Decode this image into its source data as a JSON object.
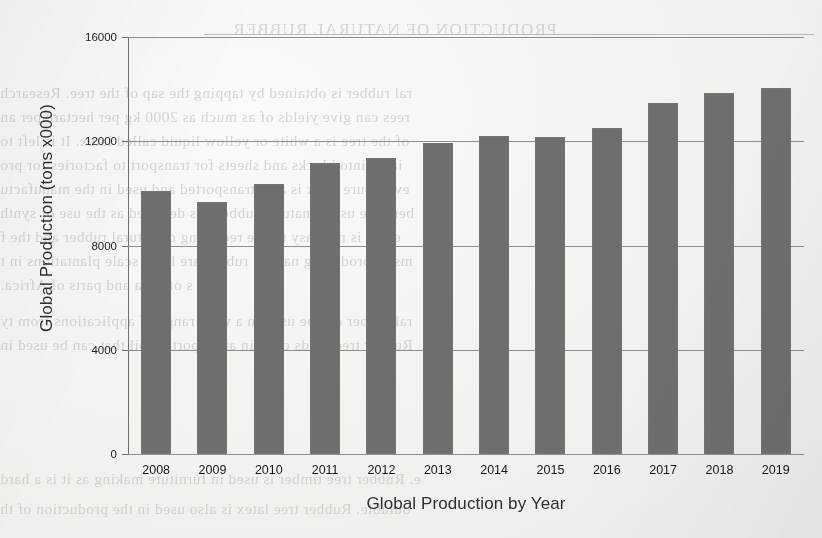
{
  "chart_data": {
    "type": "bar",
    "title": "",
    "xlabel": "Global Production by Year",
    "ylabel": "Global Production (tons x000)",
    "categories": [
      "2008",
      "2009",
      "2010",
      "2011",
      "2012",
      "2013",
      "2014",
      "2015",
      "2016",
      "2017",
      "2018",
      "2019"
    ],
    "values": [
      10100,
      9670,
      10370,
      11170,
      11360,
      11940,
      12200,
      12170,
      12500,
      13470,
      13850,
      14050
    ],
    "ylim": [
      0,
      16000
    ],
    "yticks": [
      0,
      4000,
      8000,
      12000,
      16000
    ],
    "ytick_labels": [
      "0",
      "4000",
      "8000",
      "12000",
      "16000"
    ],
    "grid": true,
    "legend": false,
    "bar_color": "#6e6e6e",
    "background_color": "#f3f2ef",
    "gridline_color": "#8e8e8e"
  },
  "page_bleed": {
    "heading": "PRODUCTION OF NATURAL RUBBER",
    "lines": [
      "ral rubber is obtained by tapping the sap of the tree. Research",
      "rees can give yields of as much as 2000 kg per hectare per an",
      "of the tree is a white or yellow liquid called latex. It is left to",
      "iated into blocks and sheets for transport to factories for pro",
      "ever, pure latex is also transported and used in the manufactu",
      "ber. The use of natural rubber has declined as the use of synth",
      "ed. It is not easy to use recycling of natural rubber and the f",
      "ms of producing natural rubber are large scale plantations in t",
      "s of Asia and parts of Africa.",
      "ral rubber can be used in a wide range of applications from ty",
      "Rubber tree seeds contain an important oil that can be used in",
      "e. Rubber tree timber is used in furniture making as it is a hard",
      "ourable. Rubber tree latex is also used in the production of th"
    ]
  }
}
